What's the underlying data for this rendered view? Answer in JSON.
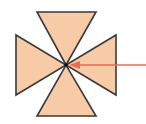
{
  "diagram": {
    "center": [
      66,
      65
    ],
    "fill_color": "#F6CBA5",
    "stroke_color": "#3a3a3a",
    "arrow_color": "#EE6A55",
    "triangles": [
      {
        "name": "top",
        "points": [
          [
            37,
            12
          ],
          [
            96,
            12
          ],
          [
            66,
            65
          ]
        ]
      },
      {
        "name": "bottom",
        "points": [
          [
            37,
            116
          ],
          [
            96,
            116
          ],
          [
            66,
            65
          ]
        ]
      },
      {
        "name": "left",
        "points": [
          [
            16,
            35
          ],
          [
            16,
            95
          ],
          [
            66,
            65
          ]
        ]
      },
      {
        "name": "right",
        "points": [
          [
            116,
            35
          ],
          [
            116,
            95
          ],
          [
            66,
            65
          ]
        ]
      }
    ],
    "arrow": {
      "from": [
        146,
        65
      ],
      "to": [
        69,
        65
      ]
    }
  }
}
